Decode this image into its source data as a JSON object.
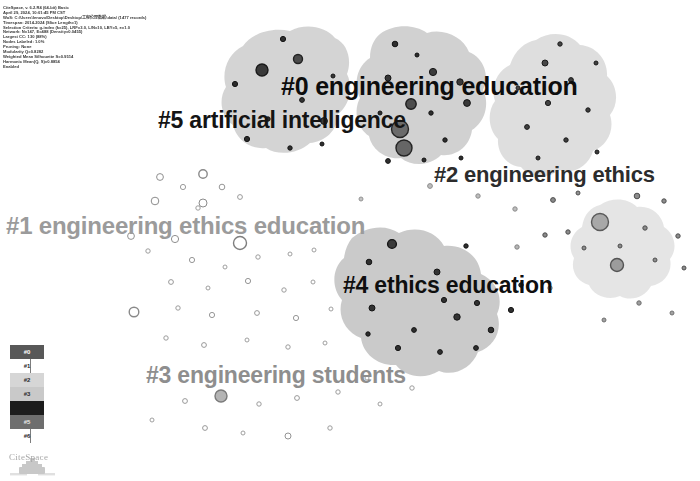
{
  "app": {
    "name": "CiteSpace",
    "watermark": "CiteSpace"
  },
  "header": {
    "lines": [
      "CiteSpace, v. 6.2.R4 (64-bit) Basic",
      "April 29, 2024, 10:01:45 PM CST",
      "WoS: C:\\Users\\lenovo\\Desktop\\Desktop\\工程伦理数据\\data\\ (1477 records)",
      "Timespan: 2014-2024 (Slice Length=1)",
      "Selection Criteria: g-index (k=25), LRF=3.0, L/N=10, LBY=5, e=1.0",
      "Network: N=147, E=488 (Density=0.0455)",
      "Largest CC: 130 (88%)",
      "Nodes Labeled: 1.0%",
      "Pruning: None",
      "Modularity Q=0.8282",
      "Weighted Mean Silhouette S=0.9514",
      "Harmonic Mean(Q, S)=0.8854",
      "Enabled"
    ]
  },
  "clusters": [
    {
      "id": "#0",
      "label": "#0 engineering education",
      "color": "#0d0d0d"
    },
    {
      "id": "#1",
      "label": "#1 engineering ethics education",
      "color": "#9b9b9b"
    },
    {
      "id": "#2",
      "label": "#2 engineering ethics",
      "color": "#2c2c2c"
    },
    {
      "id": "#3",
      "label": "#3 engineering students",
      "color": "#8e8e8e"
    },
    {
      "id": "#4",
      "label": "#4 ethics education",
      "color": "#0f0f0f"
    },
    {
      "id": "#5",
      "label": "#5 artificial intelligence",
      "color": "#141414"
    }
  ],
  "legend": {
    "entries": [
      {
        "id": "#0",
        "swatch": "#585858",
        "text_color": "#ffffff",
        "inside": true
      },
      {
        "id": "#1",
        "swatch": "#ffffff",
        "text_color": "#2a2a2a",
        "inside": false
      },
      {
        "id": "#2",
        "swatch": "#d6d6d6",
        "text_color": "#2a2a2a",
        "inside": true
      },
      {
        "id": "#3",
        "swatch": "#c9c9c9",
        "text_color": "#2a2a2a",
        "inside": true
      },
      {
        "id": "#4",
        "swatch": "#1c1c1c",
        "text_color": "#1c1c1c",
        "inside": true
      },
      {
        "id": "#5",
        "swatch": "#6e6e6e",
        "text_color": "#e8e8e8",
        "inside": true
      },
      {
        "id": "#6",
        "swatch": "#ffffff",
        "text_color": "#2a2a2a",
        "inside": false
      }
    ]
  },
  "chart_data": {
    "type": "scatter",
    "xlabel": "",
    "ylabel": "",
    "grid": false,
    "legend_position": "bottom-left",
    "cluster_hulls": [
      {
        "id": "#5",
        "fill": "#d2d2d2",
        "path": "M243,46 C252,33 272,27 290,31 C305,23 325,26 335,38 C348,44 352,60 347,74 C354,88 349,106 338,114 C338,130 325,142 310,143 C298,154 278,156 266,148 C250,150 236,139 233,125 C221,117 218,99 226,87 C221,72 228,53 243,46 Z"
      },
      {
        "id": "#0",
        "fill": "#cfcfcf",
        "path": "M380,34 C394,24 414,24 427,33 C444,28 463,37 469,52 C484,58 490,76 483,90 C490,104 485,122 472,130 C470,146 456,157 441,155 C430,166 412,167 401,158 C386,160 372,150 369,136 C357,128 353,111 360,98 C353,84 357,66 370,58 C370,47 374,39 380,34 Z"
      },
      {
        "id": "#2",
        "fill": "#dcdcdc",
        "path": "M536,40 C551,30 570,33 580,45 C596,46 608,60 607,76 C618,86 619,104 610,115 C615,130 607,146 593,151 C589,166 573,175 559,170 C547,180 530,178 521,167 C507,166 497,153 498,139 C488,129 487,112 495,101 C490,87 497,71 510,65 C515,50 525,42 536,40 Z"
      },
      {
        "id": "#4",
        "fill": "#c7c7c7",
        "path": "M352,238 C366,226 386,224 399,233 C416,225 436,231 444,246 C463,244 479,256 481,274 C497,281 504,299 497,314 C503,330 494,347 478,352 C472,368 454,377 439,371 C424,380 405,377 396,365 C378,366 363,354 361,338 C345,332 337,315 342,300 C331,288 332,268 344,258 C345,250 348,243 352,238 Z"
      },
      {
        "id": "#6",
        "fill": "#e4e4e4",
        "path": "M600,205 C612,197 628,198 637,207 C650,205 662,214 664,227 C675,234 678,249 670,259 C673,272 664,284 651,286 C645,297 631,302 620,296 C608,301 594,296 589,285 C577,282 570,270 574,258 C567,247 571,233 582,227 C584,214 591,207 600,205 Z"
      }
    ],
    "nodes": [
      {
        "cx": 262,
        "cy": 70,
        "r": 6.0,
        "fill": "#3a3a3a",
        "stroke": "#1a1a1a"
      },
      {
        "cx": 298,
        "cy": 59,
        "r": 4.5,
        "fill": "#4a4a4a",
        "stroke": "#222222"
      },
      {
        "cx": 235,
        "cy": 84,
        "r": 2.6,
        "fill": "#2b2b2b",
        "stroke": "#141414"
      },
      {
        "cx": 302,
        "cy": 100,
        "r": 2.4,
        "fill": "#333333",
        "stroke": "#141414"
      },
      {
        "cx": 268,
        "cy": 119,
        "r": 2.2,
        "fill": "#2e2e2e",
        "stroke": "#141414"
      },
      {
        "cx": 324,
        "cy": 121,
        "r": 3.4,
        "fill": "#3c3c3c",
        "stroke": "#161616"
      },
      {
        "cx": 247,
        "cy": 139,
        "r": 2.6,
        "fill": "#2a2a2a",
        "stroke": "#121212"
      },
      {
        "cx": 290,
        "cy": 148,
        "r": 2.2,
        "fill": "#303030",
        "stroke": "#131313"
      },
      {
        "cx": 322,
        "cy": 144,
        "r": 2.0,
        "fill": "#2d2d2d",
        "stroke": "#131313"
      },
      {
        "cx": 283,
        "cy": 39,
        "r": 2.6,
        "fill": "#2f2f2f",
        "stroke": "#121212"
      },
      {
        "cx": 333,
        "cy": 76,
        "r": 2.0,
        "fill": "#353535",
        "stroke": "#141414"
      },
      {
        "cx": 400,
        "cy": 129,
        "r": 8.5,
        "fill": "#6b6b6b",
        "stroke": "#262626"
      },
      {
        "cx": 404,
        "cy": 148,
        "r": 8.0,
        "fill": "#666666",
        "stroke": "#242424"
      },
      {
        "cx": 411,
        "cy": 104,
        "r": 5.2,
        "fill": "#4d4d4d",
        "stroke": "#1e1e1e"
      },
      {
        "cx": 388,
        "cy": 78,
        "r": 3.0,
        "fill": "#363636",
        "stroke": "#151515"
      },
      {
        "cx": 433,
        "cy": 72,
        "r": 3.6,
        "fill": "#3b3b3b",
        "stroke": "#161616"
      },
      {
        "cx": 460,
        "cy": 82,
        "r": 3.2,
        "fill": "#3a3a3a",
        "stroke": "#161616"
      },
      {
        "cx": 467,
        "cy": 103,
        "r": 3.4,
        "fill": "#393939",
        "stroke": "#151515"
      },
      {
        "cx": 431,
        "cy": 113,
        "r": 2.2,
        "fill": "#2e2e2e",
        "stroke": "#131313"
      },
      {
        "cx": 380,
        "cy": 113,
        "r": 2.0,
        "fill": "#2d2d2d",
        "stroke": "#131313"
      },
      {
        "cx": 395,
        "cy": 44,
        "r": 2.8,
        "fill": "#2f2f2f",
        "stroke": "#131313"
      },
      {
        "cx": 417,
        "cy": 55,
        "r": 2.0,
        "fill": "#2c2c2c",
        "stroke": "#121212"
      },
      {
        "cx": 445,
        "cy": 140,
        "r": 2.2,
        "fill": "#2e2e2e",
        "stroke": "#131313"
      },
      {
        "cx": 388,
        "cy": 161,
        "r": 2.4,
        "fill": "#303030",
        "stroke": "#131313"
      },
      {
        "cx": 424,
        "cy": 160,
        "r": 2.0,
        "fill": "#2d2d2d",
        "stroke": "#131313"
      },
      {
        "cx": 461,
        "cy": 158,
        "r": 2.0,
        "fill": "#2c2c2c",
        "stroke": "#131313"
      },
      {
        "cx": 545,
        "cy": 63,
        "r": 3.0,
        "fill": "#474747",
        "stroke": "#1b1b1b"
      },
      {
        "cx": 571,
        "cy": 80,
        "r": 2.4,
        "fill": "#3f3f3f",
        "stroke": "#1a1a1a"
      },
      {
        "cx": 548,
        "cy": 103,
        "r": 2.6,
        "fill": "#424242",
        "stroke": "#1a1a1a"
      },
      {
        "cx": 588,
        "cy": 110,
        "r": 2.2,
        "fill": "#3d3d3d",
        "stroke": "#191919"
      },
      {
        "cx": 527,
        "cy": 127,
        "r": 2.4,
        "fill": "#414141",
        "stroke": "#1a1a1a"
      },
      {
        "cx": 566,
        "cy": 140,
        "r": 2.2,
        "fill": "#3e3e3e",
        "stroke": "#191919"
      },
      {
        "cx": 597,
        "cy": 152,
        "r": 2.0,
        "fill": "#3c3c3c",
        "stroke": "#181818"
      },
      {
        "cx": 538,
        "cy": 158,
        "r": 2.0,
        "fill": "#3b3b3b",
        "stroke": "#181818"
      },
      {
        "cx": 518,
        "cy": 88,
        "r": 2.0,
        "fill": "#454545",
        "stroke": "#1b1b1b"
      },
      {
        "cx": 596,
        "cy": 63,
        "r": 2.0,
        "fill": "#404040",
        "stroke": "#191919"
      },
      {
        "cx": 560,
        "cy": 44,
        "r": 2.2,
        "fill": "#444444",
        "stroke": "#1b1b1b"
      },
      {
        "cx": 600,
        "cy": 222,
        "r": 8.5,
        "fill": "#a8a8a8",
        "stroke": "#5a5a5a"
      },
      {
        "cx": 617,
        "cy": 265,
        "r": 6.5,
        "fill": "#9c9c9c",
        "stroke": "#545454"
      },
      {
        "cx": 553,
        "cy": 200,
        "r": 2.4,
        "fill": "#8a8a8a",
        "stroke": "#4e4e4e"
      },
      {
        "cx": 578,
        "cy": 193,
        "r": 2.0,
        "fill": "#909090",
        "stroke": "#505050"
      },
      {
        "cx": 637,
        "cy": 196,
        "r": 2.8,
        "fill": "#8c8c8c",
        "stroke": "#4e4e4e"
      },
      {
        "cx": 664,
        "cy": 201,
        "r": 2.2,
        "fill": "#8e8e8e",
        "stroke": "#4f4f4f"
      },
      {
        "cx": 645,
        "cy": 228,
        "r": 2.2,
        "fill": "#8b8b8b",
        "stroke": "#4e4e4e"
      },
      {
        "cx": 678,
        "cy": 236,
        "r": 2.2,
        "fill": "#8d8d8d",
        "stroke": "#4f4f4f"
      },
      {
        "cx": 545,
        "cy": 235,
        "r": 2.2,
        "fill": "#8a8a8a",
        "stroke": "#4d4d4d"
      },
      {
        "cx": 568,
        "cy": 232,
        "r": 2.2,
        "fill": "#8b8b8b",
        "stroke": "#4e4e4e"
      },
      {
        "cx": 584,
        "cy": 248,
        "r": 2.0,
        "fill": "#8c8c8c",
        "stroke": "#4e4e4e"
      },
      {
        "cx": 620,
        "cy": 246,
        "r": 2.0,
        "fill": "#8a8a8a",
        "stroke": "#4d4d4d"
      },
      {
        "cx": 655,
        "cy": 260,
        "r": 2.0,
        "fill": "#8d8d8d",
        "stroke": "#4f4f4f"
      },
      {
        "cx": 684,
        "cy": 268,
        "r": 2.0,
        "fill": "#8c8c8c",
        "stroke": "#4e4e4e"
      },
      {
        "cx": 392,
        "cy": 244,
        "r": 4.4,
        "fill": "#3a3a3a",
        "stroke": "#161616"
      },
      {
        "cx": 369,
        "cy": 262,
        "r": 2.8,
        "fill": "#303030",
        "stroke": "#141414"
      },
      {
        "cx": 437,
        "cy": 272,
        "r": 3.0,
        "fill": "#333333",
        "stroke": "#151515"
      },
      {
        "cx": 372,
        "cy": 308,
        "r": 3.0,
        "fill": "#323232",
        "stroke": "#151515"
      },
      {
        "cx": 444,
        "cy": 300,
        "r": 2.6,
        "fill": "#2f2f2f",
        "stroke": "#141414"
      },
      {
        "cx": 477,
        "cy": 303,
        "r": 2.6,
        "fill": "#313131",
        "stroke": "#141414"
      },
      {
        "cx": 511,
        "cy": 310,
        "r": 2.6,
        "fill": "#303030",
        "stroke": "#141414"
      },
      {
        "cx": 457,
        "cy": 317,
        "r": 3.2,
        "fill": "#343434",
        "stroke": "#151515"
      },
      {
        "cx": 491,
        "cy": 330,
        "r": 2.8,
        "fill": "#2f2f2f",
        "stroke": "#141414"
      },
      {
        "cx": 414,
        "cy": 330,
        "r": 2.4,
        "fill": "#2e2e2e",
        "stroke": "#141414"
      },
      {
        "cx": 398,
        "cy": 348,
        "r": 2.6,
        "fill": "#303030",
        "stroke": "#141414"
      },
      {
        "cx": 440,
        "cy": 352,
        "r": 2.4,
        "fill": "#2f2f2f",
        "stroke": "#141414"
      },
      {
        "cx": 476,
        "cy": 348,
        "r": 2.4,
        "fill": "#2e2e2e",
        "stroke": "#141414"
      },
      {
        "cx": 368,
        "cy": 334,
        "r": 2.2,
        "fill": "#2d2d2d",
        "stroke": "#131313"
      },
      {
        "cx": 521,
        "cy": 285,
        "r": 2.2,
        "fill": "#303030",
        "stroke": "#141414"
      },
      {
        "cx": 466,
        "cy": 246,
        "r": 2.2,
        "fill": "#2f2f2f",
        "stroke": "#141414"
      },
      {
        "cx": 160,
        "cy": 177,
        "r": 3.4,
        "fill": "#ffffff",
        "stroke": "#8f8f8f"
      },
      {
        "cx": 183,
        "cy": 187,
        "r": 2.6,
        "fill": "#ffffff",
        "stroke": "#9b9b9b"
      },
      {
        "cx": 203,
        "cy": 174,
        "r": 4.2,
        "fill": "#ffffff",
        "stroke": "#8a8a8a"
      },
      {
        "cx": 222,
        "cy": 187,
        "r": 2.8,
        "fill": "#ffffff",
        "stroke": "#979797"
      },
      {
        "cx": 155,
        "cy": 201,
        "r": 3.8,
        "fill": "#ffffff",
        "stroke": "#8d8d8d"
      },
      {
        "cx": 203,
        "cy": 203,
        "r": 4.0,
        "fill": "#ffffff",
        "stroke": "#8c8c8c"
      },
      {
        "cx": 240,
        "cy": 197,
        "r": 2.4,
        "fill": "#ffffff",
        "stroke": "#9a9a9a"
      },
      {
        "cx": 131,
        "cy": 236,
        "r": 3.4,
        "fill": "#ffffff",
        "stroke": "#919191"
      },
      {
        "cx": 175,
        "cy": 239,
        "r": 3.6,
        "fill": "#ffffff",
        "stroke": "#8f8f8f"
      },
      {
        "cx": 240,
        "cy": 243,
        "r": 6.5,
        "fill": "#ffffff",
        "stroke": "#7e7e7e"
      },
      {
        "cx": 198,
        "cy": 208,
        "r": 2.2,
        "fill": "#ffffff",
        "stroke": "#9d9d9d"
      },
      {
        "cx": 148,
        "cy": 251,
        "r": 2.2,
        "fill": "#ffffff",
        "stroke": "#9d9d9d"
      },
      {
        "cx": 192,
        "cy": 260,
        "r": 2.6,
        "fill": "#ffffff",
        "stroke": "#979797"
      },
      {
        "cx": 225,
        "cy": 267,
        "r": 2.0,
        "fill": "#ffffff",
        "stroke": "#a0a0a0"
      },
      {
        "cx": 258,
        "cy": 257,
        "r": 2.2,
        "fill": "#ffffff",
        "stroke": "#9d9d9d"
      },
      {
        "cx": 290,
        "cy": 254,
        "r": 2.0,
        "fill": "#ffffff",
        "stroke": "#a0a0a0"
      },
      {
        "cx": 314,
        "cy": 250,
        "r": 2.0,
        "fill": "#ffffff",
        "stroke": "#a0a0a0"
      },
      {
        "cx": 171,
        "cy": 282,
        "r": 2.4,
        "fill": "#ffffff",
        "stroke": "#999999"
      },
      {
        "cx": 208,
        "cy": 288,
        "r": 2.0,
        "fill": "#ffffff",
        "stroke": "#a0a0a0"
      },
      {
        "cx": 248,
        "cy": 281,
        "r": 2.6,
        "fill": "#ffffff",
        "stroke": "#969696"
      },
      {
        "cx": 284,
        "cy": 290,
        "r": 2.2,
        "fill": "#ffffff",
        "stroke": "#9c9c9c"
      },
      {
        "cx": 313,
        "cy": 282,
        "r": 2.0,
        "fill": "#ffffff",
        "stroke": "#a0a0a0"
      },
      {
        "cx": 134,
        "cy": 312,
        "r": 4.8,
        "fill": "#ffffff",
        "stroke": "#898989"
      },
      {
        "cx": 178,
        "cy": 308,
        "r": 2.2,
        "fill": "#ffffff",
        "stroke": "#9c9c9c"
      },
      {
        "cx": 212,
        "cy": 315,
        "r": 2.6,
        "fill": "#ffffff",
        "stroke": "#979797"
      },
      {
        "cx": 257,
        "cy": 313,
        "r": 2.4,
        "fill": "#ffffff",
        "stroke": "#999999"
      },
      {
        "cx": 296,
        "cy": 318,
        "r": 2.6,
        "fill": "#ffffff",
        "stroke": "#979797"
      },
      {
        "cx": 331,
        "cy": 309,
        "r": 2.0,
        "fill": "#ffffff",
        "stroke": "#a0a0a0"
      },
      {
        "cx": 166,
        "cy": 338,
        "r": 2.2,
        "fill": "#ffffff",
        "stroke": "#9c9c9c"
      },
      {
        "cx": 204,
        "cy": 345,
        "r": 2.4,
        "fill": "#ffffff",
        "stroke": "#999999"
      },
      {
        "cx": 247,
        "cy": 340,
        "r": 2.0,
        "fill": "#ffffff",
        "stroke": "#a0a0a0"
      },
      {
        "cx": 288,
        "cy": 347,
        "r": 2.2,
        "fill": "#ffffff",
        "stroke": "#9c9c9c"
      },
      {
        "cx": 325,
        "cy": 343,
        "r": 2.0,
        "fill": "#ffffff",
        "stroke": "#a0a0a0"
      },
      {
        "cx": 221,
        "cy": 396,
        "r": 6.0,
        "fill": "#b4b4b4",
        "stroke": "#7a7a7a"
      },
      {
        "cx": 185,
        "cy": 401,
        "r": 2.4,
        "fill": "#ffffff",
        "stroke": "#999999"
      },
      {
        "cx": 259,
        "cy": 404,
        "r": 2.2,
        "fill": "#ffffff",
        "stroke": "#9c9c9c"
      },
      {
        "cx": 297,
        "cy": 398,
        "r": 2.4,
        "fill": "#ffffff",
        "stroke": "#999999"
      },
      {
        "cx": 338,
        "cy": 392,
        "r": 2.2,
        "fill": "#ffffff",
        "stroke": "#9c9c9c"
      },
      {
        "cx": 205,
        "cy": 428,
        "r": 2.4,
        "fill": "#ffffff",
        "stroke": "#999999"
      },
      {
        "cx": 243,
        "cy": 433,
        "r": 2.0,
        "fill": "#ffffff",
        "stroke": "#a0a0a0"
      },
      {
        "cx": 288,
        "cy": 436,
        "r": 3.0,
        "fill": "#ffffff",
        "stroke": "#949494"
      },
      {
        "cx": 330,
        "cy": 428,
        "r": 2.2,
        "fill": "#ffffff",
        "stroke": "#9c9c9c"
      },
      {
        "cx": 152,
        "cy": 420,
        "r": 2.0,
        "fill": "#ffffff",
        "stroke": "#a0a0a0"
      },
      {
        "cx": 380,
        "cy": 404,
        "r": 2.0,
        "fill": "#ffffff",
        "stroke": "#a0a0a0"
      },
      {
        "cx": 412,
        "cy": 388,
        "r": 2.2,
        "fill": "#ffffff",
        "stroke": "#9c9c9c"
      },
      {
        "cx": 367,
        "cy": 378,
        "r": 2.0,
        "fill": "#ffffff",
        "stroke": "#a0a0a0"
      },
      {
        "cx": 430,
        "cy": 186,
        "r": 2.4,
        "fill": "#bdbdbd",
        "stroke": "#8d8d8d"
      },
      {
        "cx": 478,
        "cy": 196,
        "r": 2.2,
        "fill": "#bdbdbd",
        "stroke": "#8d8d8d"
      },
      {
        "cx": 515,
        "cy": 209,
        "r": 2.2,
        "fill": "#bdbdbd",
        "stroke": "#8d8d8d"
      },
      {
        "cx": 361,
        "cy": 199,
        "r": 2.0,
        "fill": "#c4c4c4",
        "stroke": "#949494"
      },
      {
        "cx": 517,
        "cy": 247,
        "r": 2.2,
        "fill": "#b5b5b5",
        "stroke": "#858585"
      },
      {
        "cx": 550,
        "cy": 288,
        "r": 2.2,
        "fill": "#b5b5b5",
        "stroke": "#858585"
      },
      {
        "cx": 639,
        "cy": 303,
        "r": 2.2,
        "fill": "#9e9e9e",
        "stroke": "#6e6e6e"
      },
      {
        "cx": 672,
        "cy": 313,
        "r": 2.0,
        "fill": "#a2a2a2",
        "stroke": "#727272"
      },
      {
        "cx": 604,
        "cy": 320,
        "r": 2.0,
        "fill": "#a0a0a0",
        "stroke": "#707070"
      }
    ]
  }
}
